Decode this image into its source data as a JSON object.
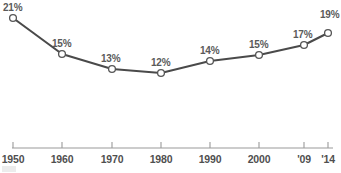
{
  "chart_data": {
    "type": "line",
    "title": "",
    "subtitle": "",
    "xlabel": "",
    "ylabel": "",
    "grid": false,
    "legend": "none",
    "categories": [
      "1950",
      "1960",
      "1970",
      "1980",
      "1990",
      "2000",
      "'09",
      "'14"
    ],
    "x": [
      1950,
      1960,
      1970,
      1980,
      1990,
      2000,
      2009,
      2014
    ],
    "values": [
      21,
      13,
      15,
      12,
      14,
      15,
      17,
      19
    ],
    "series": [
      {
        "name": "Share",
        "values": [
          21,
          15,
          13,
          12,
          14,
          15,
          17,
          19
        ],
        "point_labels": [
          "21%",
          "15%",
          "13%",
          "12%",
          "14%",
          "15%",
          "17%",
          "19%"
        ]
      }
    ],
    "ylim": [
      11,
      22
    ],
    "yunit": "%",
    "axis_ticks": [
      "1950",
      "1960",
      "1970",
      "1980",
      "1990",
      "2000",
      "'09",
      "'14"
    ],
    "colors": {
      "line": "#4a4a4a",
      "marker_fill": "#ffffff",
      "marker_stroke": "#555555",
      "label_text": "#5a5a5a",
      "tick_text": "#4f4f4f",
      "axis_line": "#9a9a9a",
      "background": "#ffffff"
    }
  },
  "points": [
    {
      "label": "21%",
      "tick": "1950",
      "value": 21,
      "cx": 13,
      "cy": 18,
      "lx": 3,
      "ly": 2,
      "tx": 13
    },
    {
      "label": "15%",
      "tick": "1960",
      "value": 15,
      "cx": 62,
      "cy": 54,
      "lx": 52,
      "ly": 38,
      "tx": 62
    },
    {
      "label": "13%",
      "tick": "1970",
      "value": 13,
      "cx": 112,
      "cy": 69,
      "lx": 101,
      "ly": 53,
      "tx": 112
    },
    {
      "label": "12%",
      "tick": "1980",
      "value": 12,
      "cx": 161,
      "cy": 73,
      "lx": 151,
      "ly": 57,
      "tx": 161
    },
    {
      "label": "14%",
      "tick": "1990",
      "value": 14,
      "cx": 210,
      "cy": 61,
      "lx": 200,
      "ly": 45,
      "tx": 210
    },
    {
      "label": "15%",
      "tick": "2000",
      "value": 15,
      "cx": 259,
      "cy": 55,
      "lx": 249,
      "ly": 39,
      "tx": 259
    },
    {
      "label": "17%",
      "tick": "'09",
      "value": 17,
      "cx": 304,
      "cy": 45,
      "lx": 293,
      "ly": 29,
      "tx": 304
    },
    {
      "label": "19%",
      "tick": "'14",
      "value": 19,
      "cx": 328,
      "cy": 33,
      "lx": 320,
      "ly": 9,
      "tx": 328
    }
  ]
}
